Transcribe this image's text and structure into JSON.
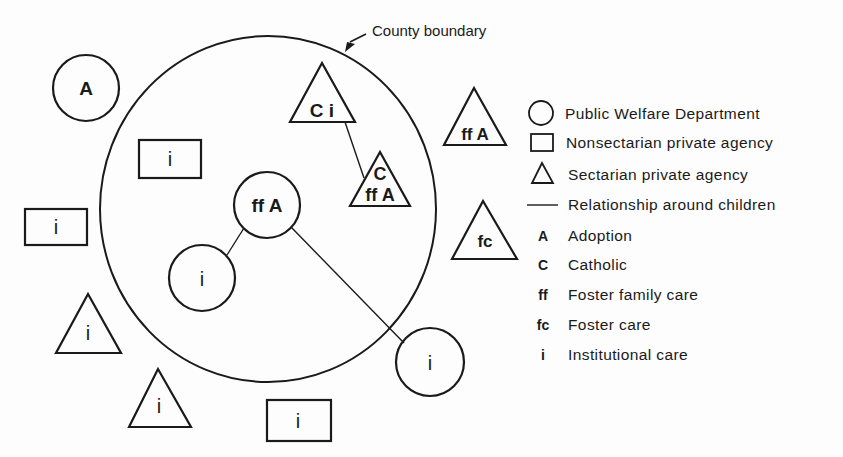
{
  "diagram": {
    "boundary_label": "County boundary",
    "nodes": [
      {
        "id": "circle-a-outside",
        "shape": "circle",
        "codes": "A"
      },
      {
        "id": "rect-i-inner",
        "shape": "rectangle",
        "codes": "i"
      },
      {
        "id": "circle-ff-a",
        "shape": "circle",
        "codes": "ff A"
      },
      {
        "id": "triangle-c-i",
        "shape": "triangle",
        "codes": "C i"
      },
      {
        "id": "triangle-c-ff-a",
        "shape": "triangle",
        "codes_top": "C",
        "codes_bottom": "ff A"
      },
      {
        "id": "rect-i-left",
        "shape": "rectangle",
        "codes": "i"
      },
      {
        "id": "circle-i-inner",
        "shape": "circle",
        "codes": "i"
      },
      {
        "id": "circle-i-right",
        "shape": "circle",
        "codes": "i"
      },
      {
        "id": "triangle-ff-a-outside",
        "shape": "triangle",
        "codes": "ff A"
      },
      {
        "id": "triangle-fc-outside",
        "shape": "triangle",
        "codes": "fc"
      },
      {
        "id": "triangle-i-left",
        "shape": "triangle",
        "codes": "i"
      },
      {
        "id": "triangle-i-bottom",
        "shape": "triangle",
        "codes": "i"
      },
      {
        "id": "rect-i-bottom",
        "shape": "rectangle",
        "codes": "i"
      }
    ],
    "edges": [
      {
        "from": "triangle-c-i",
        "to": "triangle-c-ff-a"
      },
      {
        "from": "circle-ff-a",
        "to": "circle-i-inner"
      },
      {
        "from": "circle-ff-a",
        "to": "circle-i-right"
      }
    ]
  },
  "legend": {
    "shapes": [
      {
        "symbol": "circle",
        "label": "Public Welfare Department"
      },
      {
        "symbol": "rectangle",
        "label": "Nonsectarian private agency"
      },
      {
        "symbol": "triangle",
        "label": "Sectarian private agency"
      },
      {
        "symbol": "line",
        "label": "Relationship around children"
      }
    ],
    "codes": [
      {
        "code": "A",
        "label": "Adoption"
      },
      {
        "code": "C",
        "label": "Catholic"
      },
      {
        "code": "ff",
        "label": "Foster family care"
      },
      {
        "code": "fc",
        "label": "Foster care"
      },
      {
        "code": "i",
        "label": "Institutional care"
      }
    ]
  }
}
